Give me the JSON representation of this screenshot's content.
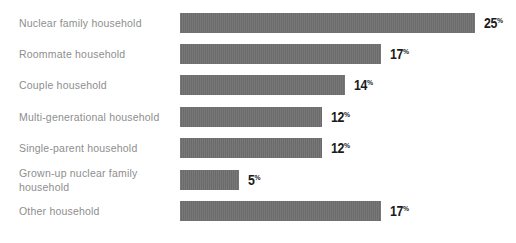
{
  "chart_data": {
    "type": "bar",
    "orientation": "horizontal",
    "title": "",
    "categories": [
      "Nuclear family household",
      "Roommate household",
      "Couple household",
      "Multi-generational household",
      "Single-parent household",
      "Grown-up nuclear family household",
      "Other household"
    ],
    "values": [
      25,
      17,
      14,
      12,
      12,
      5,
      17
    ],
    "unit": "%",
    "xlabel": "",
    "ylabel": "",
    "xlim": [
      0,
      25
    ],
    "grid": false,
    "legend": false,
    "bar_color": "#717171",
    "category_label_color": "#8e8e8e",
    "value_label_color": "#1a1a1a",
    "background_color": "#ffffff"
  }
}
